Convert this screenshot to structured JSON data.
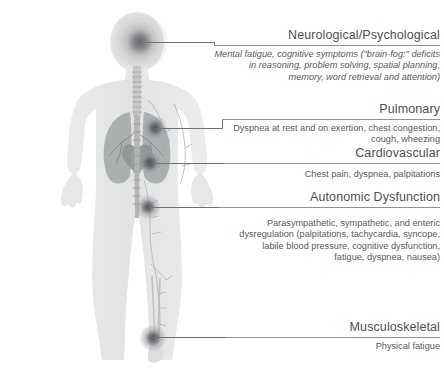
{
  "diagram": {
    "figure_alt": "Anterior view of a translucent human body showing lungs, trachea, heart and vascular-lymphatic network",
    "line_color": "#6d7074",
    "rule_color": "#8e9195",
    "heading_color": "#4d4f51",
    "body_color": "#58595b",
    "marker_color": "#4a4c50"
  },
  "labels": [
    {
      "id": "neurological",
      "heading": "Neurological/Psychological",
      "body": "Mental fatigue, cognitive symptoms (\"brain-fog:\" deficits in reasoning, problem solving, spatial planning, memory, word retrieval and attention)",
      "italic": true,
      "marker": "brain-marker"
    },
    {
      "id": "pulmonary",
      "heading": "Pulmonary",
      "body": "Dyspnea at rest and on exertion, chest congestion, cough, wheezing",
      "italic": false,
      "marker": "lung-marker"
    },
    {
      "id": "cardiovascular",
      "heading": "Cardiovascular",
      "body": "Chest pain, dyspnea, palpitations",
      "italic": false,
      "marker": "heart-marker"
    },
    {
      "id": "autonomic",
      "heading": "Autonomic Dysfunction",
      "body": "Parasympathetic, sympathetic, and enteric dysregulation (palpitations, tachycardia, syncope, labile blood pressure, cognitive dysfunction, fatigue, dyspnea, nausea)",
      "italic": false,
      "marker": "abdomen-marker"
    },
    {
      "id": "musculoskeletal",
      "heading": "Musculoskeletal",
      "body": "Physical fatigue",
      "italic": false,
      "marker": "leg-marker"
    }
  ]
}
